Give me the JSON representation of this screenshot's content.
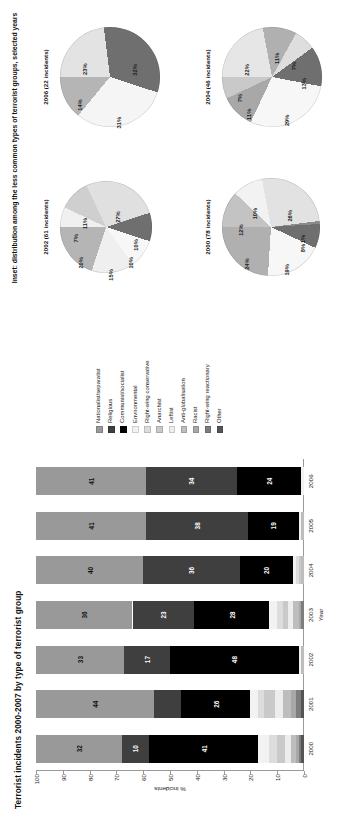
{
  "chart_data": [
    {
      "type": "bar",
      "stacked": true,
      "percent_stacked": true,
      "title": "Terrorist incidents 2000-2007 by type of terrorist group",
      "xlabel": "Year",
      "ylabel": "% incidents",
      "ylim": [
        0,
        100
      ],
      "yticks": [
        "0",
        "10",
        "20",
        "30",
        "40",
        "50",
        "60",
        "70",
        "80",
        "90",
        "100"
      ],
      "categories": [
        "2000",
        "2001",
        "2002",
        "2003",
        "2004",
        "2005",
        "2006"
      ],
      "grid": false,
      "legend_position": "right",
      "series": [
        {
          "name": "Nationalist/separatist",
          "color": "#999999",
          "values": [
            32,
            44,
            33,
            36,
            40,
            41,
            41
          ],
          "labels": [
            "32",
            "44",
            "33",
            "36",
            "40",
            "41",
            "41"
          ]
        },
        {
          "name": "Religious",
          "color": "#3f3f3f",
          "values": [
            10,
            10,
            17,
            23,
            36,
            38,
            34
          ],
          "labels": [
            "10",
            "",
            "17",
            "23",
            "36",
            "38",
            "34"
          ]
        },
        {
          "name": "Communist/socialist",
          "color": "#000000",
          "values": [
            41,
            26,
            48,
            28,
            20,
            19,
            24
          ],
          "labels": [
            "41",
            "26",
            "48",
            "28",
            "20",
            "19",
            "24"
          ]
        },
        {
          "name": "Environmental",
          "color": "#f2f2f2",
          "values": [
            4,
            3,
            1,
            3,
            1,
            1,
            1
          ],
          "labels": [
            "",
            "",
            "",
            "",
            "",
            "",
            ""
          ]
        },
        {
          "name": "Right-wing conservative",
          "color": "#dddddd",
          "values": [
            3,
            2,
            0,
            2,
            1,
            0,
            0
          ],
          "labels": [
            "",
            "",
            "",
            "",
            "",
            "",
            ""
          ]
        },
        {
          "name": "Anarchist",
          "color": "#c9c9c9",
          "values": [
            3,
            4,
            0,
            2,
            1,
            0,
            0
          ],
          "labels": [
            "",
            "",
            "",
            "",
            "",
            "",
            ""
          ]
        },
        {
          "name": "Leftist",
          "color": "#ededed",
          "values": [
            2,
            3,
            0,
            2,
            0,
            0,
            0
          ],
          "labels": [
            "",
            "",
            "",
            "",
            "",
            "",
            ""
          ]
        },
        {
          "name": "Anti-globalisation",
          "color": "#bdbdbd",
          "values": [
            2,
            3,
            1,
            2,
            1,
            1,
            0
          ],
          "labels": [
            "",
            "",
            "",
            "",
            "",
            "",
            ""
          ]
        },
        {
          "name": "Racist",
          "color": "#a8a8a8",
          "values": [
            1,
            2,
            0,
            1,
            0,
            0,
            0
          ],
          "labels": [
            "",
            "",
            "",
            "",
            "",
            "",
            ""
          ]
        },
        {
          "name": "Right-wing reactionary",
          "color": "#7d7d7d",
          "values": [
            1,
            2,
            0,
            1,
            0,
            0,
            0
          ],
          "labels": [
            "",
            "",
            "",
            "",
            "",
            "",
            ""
          ]
        },
        {
          "name": "Other",
          "color": "#545454",
          "values": [
            1,
            1,
            0,
            0,
            0,
            0,
            0
          ],
          "labels": [
            "",
            "",
            "",
            "",
            "",
            "",
            ""
          ]
        }
      ]
    },
    {
      "type": "pie",
      "id": "pie-2002",
      "caption": "2002 (61 incidents)",
      "labels": [
        "7%",
        "11%",
        "27%",
        "10%",
        "10%",
        "15%",
        "20%"
      ],
      "values": [
        7,
        11,
        27,
        10,
        10,
        15,
        20
      ],
      "colors": [
        "#f0f0f0",
        "#cfcfcf",
        "#e0e0e0",
        "#6f6f6f",
        "#f7f7f7",
        "#efefef",
        "#b5b5b5"
      ]
    },
    {
      "type": "pie",
      "id": "pie-2006",
      "caption": "2006 (22 incidents)",
      "labels": [
        "23%",
        "32%",
        "31%",
        "14%"
      ],
      "values": [
        23,
        32,
        31,
        14
      ],
      "colors": [
        "#e3e3e3",
        "#6f6f6f",
        "#f5f5f5",
        "#b5b5b5"
      ]
    },
    {
      "type": "pie",
      "id": "pie-2000",
      "caption": "2000 (78 incidents)",
      "labels": [
        "12%",
        "10%",
        "26%",
        "1%",
        "8%",
        "19%",
        "24%"
      ],
      "values": [
        12,
        10,
        26,
        1,
        8,
        19,
        24
      ],
      "colors": [
        "#c3c3c3",
        "#f2f2f2",
        "#e2e2e2",
        "#8a8a8a",
        "#6f6f6f",
        "#f7f7f7",
        "#b0b0b0"
      ]
    },
    {
      "type": "pie",
      "id": "pie-2004",
      "caption": "2004 (46 incidents)",
      "labels": [
        "22%",
        "11%",
        "7%",
        "13%",
        "29%",
        "11%",
        "7%"
      ],
      "values": [
        22,
        11,
        7,
        13,
        29,
        11,
        7
      ],
      "colors": [
        "#e6e6e6",
        "#b0b0b0",
        "#dedede",
        "#6f6f6f",
        "#f7f7f7",
        "#a8a8a8",
        "#c9c9c9"
      ]
    }
  ],
  "inset": {
    "title": "Inset: distribution among the less common types of terrorist groups, selected years"
  }
}
